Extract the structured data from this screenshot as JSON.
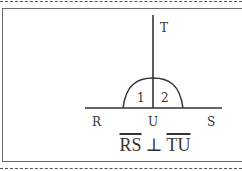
{
  "figure": {
    "points": {
      "T": "T",
      "R": "R",
      "U": "U",
      "S": "S"
    },
    "angles": {
      "angle1": "1",
      "angle2": "2"
    },
    "statement": {
      "segment1": "RS",
      "relation": "⊥",
      "segment2": "TU"
    }
  },
  "colors": {
    "line": "#333333",
    "frame": "#6a6a6a",
    "text": "#333333"
  }
}
